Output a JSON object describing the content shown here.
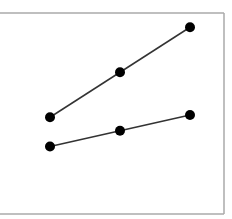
{
  "chart_data": {
    "type": "line",
    "title": "",
    "xlabel": "",
    "ylabel": "",
    "categories": [
      "1",
      "2",
      "3"
    ],
    "series": [
      {
        "name": "upper",
        "values": [
          4.3,
          6.3,
          8.3
        ],
        "color": "#000000"
      },
      {
        "name": "lower",
        "values": [
          3.0,
          3.7,
          4.4
        ],
        "color": "#000000"
      }
    ],
    "ylim": [
      0,
      9
    ],
    "grid": false,
    "legend": "none",
    "frame_color": "#aaaaaa"
  }
}
